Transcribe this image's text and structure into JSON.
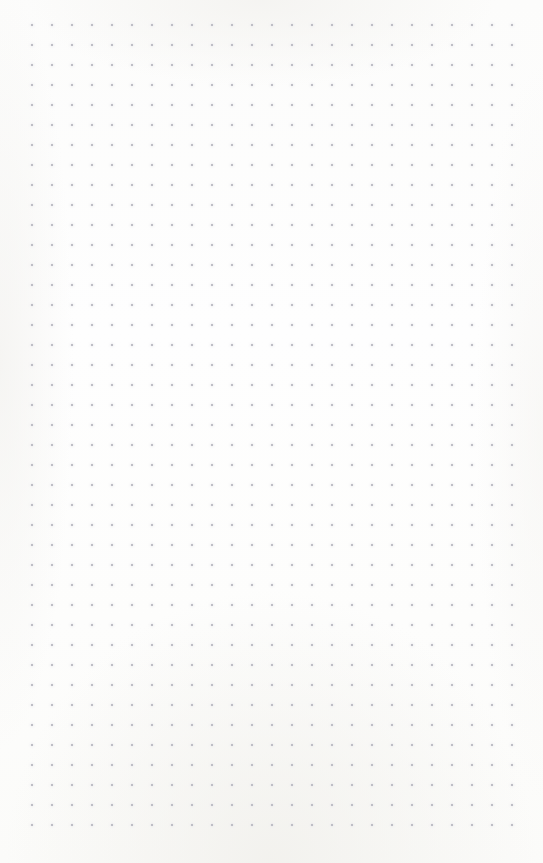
{
  "document": {
    "kind": "dot-grid-page",
    "description": "Blank dotted notebook page",
    "text_content": "",
    "page_width": 543,
    "page_height": 863,
    "background_color": "#fdfdfc"
  },
  "grid": {
    "name": "dot-grid",
    "columns": 25,
    "rows": 41,
    "spacing_px": 20,
    "dot_diameter_px": 2,
    "dot_color": "#b4b4bc",
    "origin_x": 32,
    "origin_y": 25,
    "last_dot_x": 512,
    "last_dot_y": 825,
    "margin_left": 32,
    "margin_right": 31,
    "margin_top": 25,
    "margin_bottom": 38
  }
}
